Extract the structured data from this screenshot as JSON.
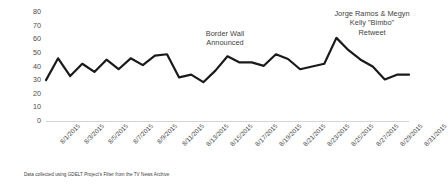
{
  "chart_data": {
    "type": "line",
    "title": "",
    "xlabel": "",
    "ylabel": "Percent",
    "ylim": [
      0,
      80
    ],
    "ytick_step": 10,
    "yticks": [
      80,
      70,
      60,
      50,
      40,
      30,
      20,
      10,
      0
    ],
    "grid": true,
    "legend": "none",
    "line_color": "#1a1a1a",
    "x": [
      "8/1/2015",
      "8/2/2015",
      "8/3/2015",
      "8/4/2015",
      "8/5/2015",
      "8/6/2015",
      "8/7/2015",
      "8/8/2015",
      "8/9/2015",
      "8/10/2015",
      "8/11/2015",
      "8/12/2015",
      "8/13/2015",
      "8/14/2015",
      "8/15/2015",
      "8/16/2015",
      "8/17/2015",
      "8/18/2015",
      "8/19/2015",
      "8/20/2015",
      "8/21/2015",
      "8/22/2015",
      "8/23/2015",
      "8/24/2015",
      "8/25/2015",
      "8/26/2015",
      "8/27/2015",
      "8/28/2015",
      "8/29/2015",
      "8/30/2015",
      "8/31/2015"
    ],
    "xtick_labels": [
      "8/1/2015",
      "8/3/2015",
      "8/5/2015",
      "8/7/2015",
      "8/9/2015",
      "8/11/2015",
      "8/13/2015",
      "8/15/2015",
      "8/17/2015",
      "8/19/2015",
      "8/21/2015",
      "8/23/2015",
      "8/25/2015",
      "8/27/2015",
      "8/29/2015",
      "8/31/2015"
    ],
    "values": [
      30,
      46,
      33,
      42,
      36,
      45,
      38,
      46,
      41,
      48,
      49,
      32,
      34,
      28.5,
      37,
      47.5,
      43,
      43,
      40.5,
      49,
      45.5,
      38,
      40,
      42,
      61,
      52,
      45,
      40,
      30.5,
      34,
      34
    ],
    "annotations": [
      {
        "label": "Border Wall\nAnnounced",
        "line1": "Border Wall",
        "line2": "Announced",
        "at_x": "8/15/2015"
      },
      {
        "label": "Jorge Ramos & Megyn Kelly \"Bimbo\" Retweet",
        "line1": "Jorge Ramos & Megyn",
        "line2": "Kelly \"Bimbo\"",
        "line3": "Retweet",
        "at_x": "8/25/2015"
      }
    ]
  },
  "axis": {
    "y_title": "Percent"
  },
  "footnote": {
    "text": "Data collected using GDELT Project's Filter from the TV News Archive"
  }
}
